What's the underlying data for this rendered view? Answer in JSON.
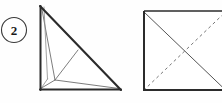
{
  "figure": {
    "background_color": "#fefefe",
    "step_badge": {
      "label": "2",
      "shape": "circle",
      "stroke_color": "#3a3a3a",
      "text_color": "#1a1a1a",
      "center_x": 14,
      "center_y": 30,
      "radius": 13
    },
    "left_figure": {
      "name": "folded-triangle",
      "description": "Right triangle with internal fold crease lines",
      "outline_color": "#2b2b2b",
      "crease_color": "#6b6b6b",
      "vertices": {
        "apex_top": [
          40,
          6
        ],
        "bottom_left": [
          40,
          90
        ],
        "bottom_right": [
          121,
          90
        ],
        "hypotenuse_mid": [
          78,
          50
        ],
        "inner_fold_vertex": [
          55,
          80
        ],
        "inner_left_vertex": [
          47,
          79
        ]
      }
    },
    "right_figure": {
      "name": "square-with-diagonals",
      "description": "Square with one solid diagonal and one dashed diagonal forming an X",
      "outline_color": "#2b2b2b",
      "solid_diagonal_color": "#555555",
      "dashed_diagonal_color": "#777777",
      "dash_pattern": "3 3",
      "corners": {
        "top_left": [
          143,
          11
        ],
        "top_right": [
          226,
          11
        ],
        "bottom_right": [
          226,
          91
        ],
        "bottom_left": [
          143,
          91
        ]
      }
    }
  }
}
